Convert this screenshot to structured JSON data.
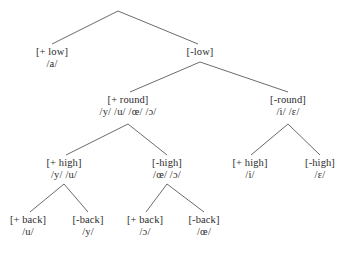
{
  "diagram": {
    "type": "feature-tree",
    "title": "",
    "background_color": "#ffffff",
    "line_color": "#5a5a5a",
    "text_color": "#2b2b2b",
    "root": {
      "label": "",
      "phonemes": ""
    },
    "nodes": [
      {
        "id": "plus-low",
        "feature": "[+ low]",
        "phonemes": "/a/",
        "x": 52,
        "y": 46,
        "level": 1
      },
      {
        "id": "minus-low",
        "feature": "[-low]",
        "phonemes": "",
        "x": 200,
        "y": 46,
        "level": 1
      },
      {
        "id": "plus-round",
        "feature": "[+ round]",
        "phonemes": "/y/ /u/ /œ/ /ɔ/",
        "x": 128,
        "y": 94,
        "level": 2
      },
      {
        "id": "minus-round",
        "feature": "[-round]",
        "phonemes": "/i/ /ɛ/",
        "x": 288,
        "y": 94,
        "level": 2
      },
      {
        "id": "plus-high-round",
        "feature": "[+ high]",
        "phonemes": "/y/ /u/",
        "x": 64,
        "y": 157,
        "level": 3
      },
      {
        "id": "minus-high-round",
        "feature": "[-high]",
        "phonemes": "/œ/ /ɔ/",
        "x": 167,
        "y": 157,
        "level": 3
      },
      {
        "id": "plus-high-unround",
        "feature": "[+ high]",
        "phonemes": "/i/",
        "x": 250,
        "y": 157,
        "level": 3
      },
      {
        "id": "minus-high-unround",
        "feature": "[-high]",
        "phonemes": "/ɛ/",
        "x": 320,
        "y": 157,
        "level": 3
      },
      {
        "id": "plus-back-high",
        "feature": "[+ back]",
        "phonemes": "/u/",
        "x": 28,
        "y": 214,
        "level": 4
      },
      {
        "id": "minus-back-high",
        "feature": "[-back]",
        "phonemes": "/y/",
        "x": 88,
        "y": 214,
        "level": 4
      },
      {
        "id": "plus-back-low",
        "feature": "[+ back]",
        "phonemes": "/ɔ/",
        "x": 145,
        "y": 214,
        "level": 4
      },
      {
        "id": "minus-back-low",
        "feature": "[-back]",
        "phonemes": "/œ/",
        "x": 204,
        "y": 214,
        "level": 4
      }
    ],
    "edges": [
      {
        "id": "root-to-plus-low",
        "x1": 118,
        "y1": 11,
        "x2": 52,
        "y2": 44
      },
      {
        "id": "root-to-minus-low",
        "x1": 118,
        "y1": 11,
        "x2": 198,
        "y2": 44
      },
      {
        "id": "minuslow-to-plusround",
        "x1": 200,
        "y1": 62,
        "x2": 130,
        "y2": 92
      },
      {
        "id": "minuslow-to-minusround",
        "x1": 200,
        "y1": 62,
        "x2": 288,
        "y2": 92
      },
      {
        "id": "plusround-to-plushigh",
        "x1": 128,
        "y1": 124,
        "x2": 66,
        "y2": 155
      },
      {
        "id": "plusround-to-minushigh",
        "x1": 128,
        "y1": 124,
        "x2": 167,
        "y2": 155
      },
      {
        "id": "minusround-to-plushigh",
        "x1": 288,
        "y1": 124,
        "x2": 251,
        "y2": 155
      },
      {
        "id": "minusround-to-minushigh",
        "x1": 288,
        "y1": 124,
        "x2": 320,
        "y2": 155
      },
      {
        "id": "plushigh-to-plusback",
        "x1": 64,
        "y1": 184,
        "x2": 30,
        "y2": 212
      },
      {
        "id": "plushigh-to-minusback",
        "x1": 64,
        "y1": 184,
        "x2": 88,
        "y2": 212
      },
      {
        "id": "minushigh-to-plusback",
        "x1": 167,
        "y1": 184,
        "x2": 146,
        "y2": 212
      },
      {
        "id": "minushigh-to-minusback",
        "x1": 167,
        "y1": 184,
        "x2": 204,
        "y2": 212
      }
    ]
  }
}
